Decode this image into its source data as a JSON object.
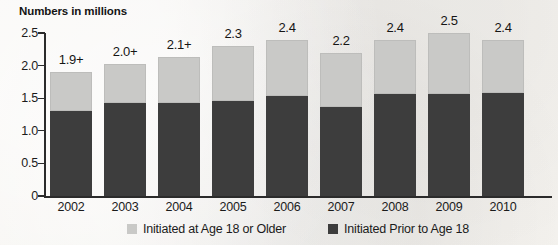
{
  "chart_data": {
    "type": "bar",
    "subtype": "stacked-bar",
    "title": "Numbers in millions",
    "xlabel": "",
    "ylabel": "",
    "ylim": [
      0,
      2.5
    ],
    "yticks": [
      "0",
      "0.5",
      "1.0",
      "1.5",
      "2.0",
      "2.5"
    ],
    "ytick_values": [
      0,
      0.5,
      1.0,
      1.5,
      2.0,
      2.5
    ],
    "grid": false,
    "legend_position": "bottom-center",
    "categories": [
      "2002",
      "2003",
      "2004",
      "2005",
      "2006",
      "2007",
      "2008",
      "2009",
      "2010"
    ],
    "series": [
      {
        "name": "Initiated Prior to Age 18",
        "color": "#3d3d3d",
        "values": [
          1.3,
          1.42,
          1.43,
          1.45,
          1.54,
          1.36,
          1.56,
          1.57,
          1.58
        ]
      },
      {
        "name": "Initiated at Age 18 or Older",
        "color": "#c9c9c7",
        "values": [
          0.6,
          0.6,
          0.7,
          0.85,
          0.86,
          0.84,
          0.84,
          0.93,
          0.82
        ]
      }
    ],
    "totals": [
      1.9,
      2.0,
      2.1,
      2.3,
      2.4,
      2.2,
      2.4,
      2.5,
      2.4
    ],
    "total_labels": [
      "1.9+",
      "2.0+",
      "2.1+",
      "2.3",
      "2.4",
      "2.2",
      "2.4",
      "2.5",
      "2.4"
    ],
    "annotations": [
      "'+' suffix denotes difference between this estimate and the 2010 estimate is statistically significant"
    ]
  },
  "legend": {
    "items": [
      {
        "label": "Initiated at Age 18 or Older",
        "swatch": "light-gray-swatch"
      },
      {
        "label": "Initiated Prior to Age 18",
        "swatch": "dark-gray-swatch"
      }
    ]
  }
}
